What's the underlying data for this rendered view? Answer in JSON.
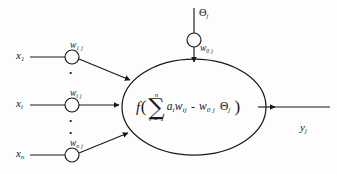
{
  "diagram": {
    "stroke_color": "#1a1a1a",
    "background_color": "#fdfdfd"
  },
  "inputs": [
    {
      "id": "input-1",
      "signal": "x",
      "signal_sub": "1",
      "weight": "w",
      "weight_sub": "1 j"
    },
    {
      "id": "input-i",
      "signal": "x",
      "signal_sub": "i",
      "weight": "w",
      "weight_sub": "i j"
    },
    {
      "id": "input-n",
      "signal": "x",
      "signal_sub": "n",
      "weight": "w",
      "weight_sub": "n j"
    }
  ],
  "bias": {
    "symbol": "Θ",
    "symbol_sub": "j",
    "weight": "w",
    "weight_sub": "0 j"
  },
  "formula": {
    "function": "f",
    "open_paren": "(",
    "sigma": "∑",
    "upper_limit": "n",
    "lower_limit": "i = 1",
    "sum_term_a": "a",
    "sum_term_a_sub": "i",
    "sum_term_w": "w",
    "sum_term_w_sub": "ij",
    "operator": "-",
    "bias_weight": "w",
    "bias_weight_sub": "0 j",
    "bias_symbol": "Θ",
    "bias_symbol_sub": "j",
    "close_paren": ")"
  },
  "output": {
    "symbol": "y",
    "symbol_sub": "j"
  },
  "ellipsis": {
    "dot": "•"
  }
}
